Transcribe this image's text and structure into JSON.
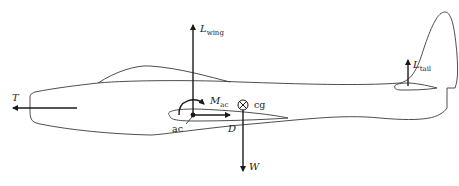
{
  "figure": {
    "labels": {
      "thrust": {
        "main": "T",
        "sub": ""
      },
      "wing_lift": {
        "main": "L",
        "sub": "wing"
      },
      "tail_lift": {
        "main": "L",
        "sub": "tail"
      },
      "moment_ac": {
        "main": "M",
        "sub": "ac"
      },
      "drag": {
        "main": "D",
        "sub": ""
      },
      "weight": {
        "main": "W",
        "sub": ""
      },
      "aerodynamic_center": "ac",
      "center_of_gravity": "cg"
    },
    "colors": {
      "line": "#3a3a3a",
      "arrow": "#1a1a1a",
      "background": "#ffffff"
    }
  }
}
